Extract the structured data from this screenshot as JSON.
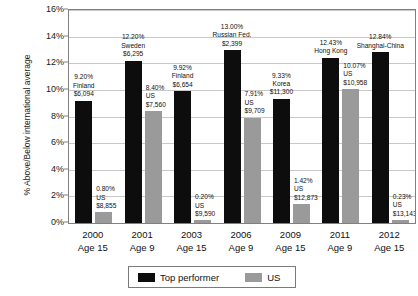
{
  "chart_data": {
    "type": "bar",
    "title": "",
    "xlabel": "",
    "ylabel": "% Above/Below international average",
    "ylim": [
      0,
      16
    ],
    "ytick_labels": [
      "0%",
      "2%",
      "4%",
      "6%",
      "8%",
      "10%",
      "12%",
      "14%",
      "16%"
    ],
    "ytick_values": [
      0,
      2,
      4,
      6,
      8,
      10,
      12,
      14,
      16
    ],
    "grid": true,
    "legend_position": "bottom-center",
    "categories": [
      "2000 Age 15",
      "2001 Age 9",
      "2003 Age 15",
      "2006 Age 9",
      "2009 Age 15",
      "2011 Age 9",
      "2012 Age 15"
    ],
    "series": [
      {
        "name": "Top performer",
        "color": "#0d0d0d",
        "values": [
          9.2,
          12.2,
          9.92,
          13.0,
          9.33,
          12.43,
          12.84
        ]
      },
      {
        "name": "US",
        "color": "#9a9a9a",
        "values": [
          0.8,
          8.4,
          0.2,
          7.91,
          1.42,
          10.07,
          0.23
        ]
      }
    ],
    "annotations": [
      {
        "series": "Top performer",
        "category_index": 0,
        "percent": "9.20%",
        "country": "Finland",
        "spending": "$6,094"
      },
      {
        "series": "US",
        "category_index": 0,
        "percent": "0.80%",
        "country": "US",
        "spending": "$8,855"
      },
      {
        "series": "Top performer",
        "category_index": 1,
        "percent": "12.20%",
        "country": "Sweden",
        "spending": "$6,295"
      },
      {
        "series": "US",
        "category_index": 1,
        "percent": "8.40%",
        "country": "US",
        "spending": "$7,560"
      },
      {
        "series": "Top performer",
        "category_index": 2,
        "percent": "9.92%",
        "country": "Finland",
        "spending": "$6,654"
      },
      {
        "series": "US",
        "category_index": 2,
        "percent": "0.20%",
        "country": "US",
        "spending": "$9,590"
      },
      {
        "series": "Top performer",
        "category_index": 3,
        "percent": "13.00%",
        "country": "Russian Fed.",
        "spending": "$2,399"
      },
      {
        "series": "US",
        "category_index": 3,
        "percent": "7.91%",
        "country": "US",
        "spending": "$9,709"
      },
      {
        "series": "Top performer",
        "category_index": 4,
        "percent": "9.33%",
        "country": "Korea",
        "spending": "$11,300"
      },
      {
        "series": "US",
        "category_index": 4,
        "percent": "1.42%",
        "country": "US",
        "spending": "$12,873"
      },
      {
        "series": "Top performer",
        "category_index": 5,
        "percent": "12.43%",
        "country": "Hong Kong",
        "spending": ""
      },
      {
        "series": "US",
        "category_index": 5,
        "percent": "10.07%",
        "country": "US",
        "spending": "$10,958"
      },
      {
        "series": "Top performer",
        "category_index": 6,
        "percent": "12.84%",
        "country": "Shanghai-China",
        "spending": ""
      },
      {
        "series": "US",
        "category_index": 6,
        "percent": "0.23%",
        "country": "US",
        "spending": "$13,143"
      }
    ]
  },
  "axis": {
    "y_title": "% Above/Below international average",
    "y_ticks": [
      "16%",
      "14%",
      "12%",
      "10%",
      "8%",
      "6%",
      "4%",
      "2%",
      "0%"
    ],
    "x_categories": [
      {
        "year": "2000",
        "age": "Age 15"
      },
      {
        "year": "2001",
        "age": "Age 9"
      },
      {
        "year": "2003",
        "age": "Age 15"
      },
      {
        "year": "2006",
        "age": "Age 9"
      },
      {
        "year": "2009",
        "age": "Age 15"
      },
      {
        "year": "2011",
        "age": "Age 9"
      },
      {
        "year": "2012",
        "age": "Age 15"
      }
    ]
  },
  "legend": {
    "items": [
      {
        "label": "Top performer",
        "color": "#0d0d0d"
      },
      {
        "label": "US",
        "color": "#9a9a9a"
      }
    ]
  }
}
